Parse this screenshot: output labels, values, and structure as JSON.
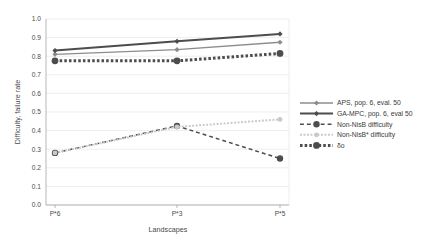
{
  "chart_data": {
    "type": "line",
    "title": "",
    "xlabel": "Landscapes",
    "ylabel": "Difficulty, failure rate",
    "categories": [
      "P*6",
      "P*3",
      "P*5"
    ],
    "ylim": [
      0.0,
      1.0
    ],
    "ytick_labels": [
      "1.0",
      "0.9",
      "0.8",
      "0.7",
      "0.6",
      "0.5",
      "0.4",
      "0.3",
      "0.2",
      "0.1",
      "0.0"
    ],
    "ytick_values": [
      1.0,
      0.9,
      0.8,
      0.7,
      0.6,
      0.5,
      0.4,
      0.3,
      0.2,
      0.1,
      0.0
    ],
    "grid": true,
    "legend_position": "right",
    "series": [
      {
        "name": "APS, pop. 6, eval. 50",
        "values": [
          0.81,
          0.835,
          0.875
        ],
        "color": "#8c8c8c",
        "style": "solid",
        "width": 1.3,
        "marker": "diamond",
        "marker_size": 2.6
      },
      {
        "name": "GA-MPC, pop. 6, eval 50",
        "values": [
          0.83,
          0.88,
          0.92
        ],
        "color": "#4d4d4d",
        "style": "solid",
        "width": 2.0,
        "marker": "diamond",
        "marker_size": 2.6
      },
      {
        "name": "Non-NisB difficulty",
        "values": [
          0.28,
          0.425,
          0.25
        ],
        "color": "#4d4d4d",
        "style": "dashed",
        "width": 1.5,
        "marker": "circle",
        "marker_size": 3.2
      },
      {
        "name": "Non-NisB* difficulty",
        "values": [
          0.28,
          0.42,
          0.46
        ],
        "color": "#c9c9c9",
        "style": "dotted",
        "width": 2.0,
        "marker": "circle",
        "marker_size": 2.4
      },
      {
        "name": "δο",
        "values": [
          0.775,
          0.775,
          0.815
        ],
        "color": "#4d4d4d",
        "style": "thick-dotted",
        "width": 3.0,
        "marker": "circle",
        "marker_size": 3.4
      }
    ]
  },
  "axes": {
    "y_title": "Difficulty, failure rate",
    "x_title": "Landscapes"
  },
  "legend": {
    "entries": [
      {
        "label": "APS, pop. 6, eval. 50"
      },
      {
        "label": "GA-MPC, pop. 6, eval 50"
      },
      {
        "label": "Non-NisB difficulty"
      },
      {
        "label": "Non-NisB* difficulty"
      },
      {
        "label": "δο"
      }
    ]
  },
  "colors": {
    "grid": "#e3e3e3",
    "axis": "#9a9a9a",
    "text": "#4a4a4a",
    "background": "#ffffff"
  }
}
